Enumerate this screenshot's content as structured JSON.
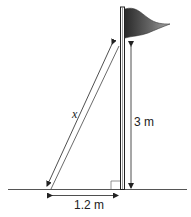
{
  "diagram": {
    "type": "flagpole-rope-right-triangle",
    "labels": {
      "hypotenuse": "x",
      "height": "3 m",
      "base": "1.2 m"
    },
    "colors": {
      "line": "#333333",
      "flag_dark": "#2a2a2a",
      "flag_light": "#9a9a9a",
      "background": "#ffffff"
    }
  }
}
